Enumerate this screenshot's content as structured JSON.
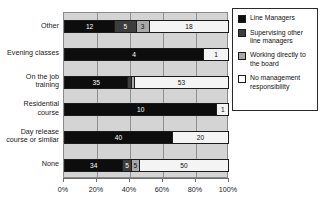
{
  "chart_data": {
    "type": "bar",
    "orientation": "horizontal",
    "stacked": true,
    "stacked_percent": true,
    "title": "",
    "subtitle": "",
    "xlabel": "",
    "ylabel": "",
    "xlim": [
      0,
      100
    ],
    "grid": true,
    "legend_position": "right",
    "xticks": [
      "0%",
      "20%",
      "40%",
      "60%",
      "80%",
      "100%"
    ],
    "xtick_values": [
      0,
      20,
      40,
      60,
      80,
      100
    ],
    "categories": [
      "Other",
      "Evening classes",
      "On the job\ntraining",
      "Residential\ncourse",
      "Day release\ncourse or similar",
      "None"
    ],
    "series": [
      {
        "name": "Line Managers",
        "color": "#0d0d0d",
        "values": [
          12,
          4,
          35,
          10,
          40,
          34
        ]
      },
      {
        "name": "Supervising other line managers",
        "color": "#3d3d3d",
        "values": [
          5,
          0,
          1,
          0,
          0,
          5
        ]
      },
      {
        "name": "Working directly to the board",
        "color": "#a8a8a8",
        "values": [
          3,
          0,
          1,
          0,
          0,
          5
        ]
      },
      {
        "name": "No management responsibility",
        "color": "#f4f4f4",
        "values": [
          18,
          1,
          53,
          1,
          20,
          50
        ]
      }
    ],
    "segment_percents": [
      [
        31,
        13,
        8,
        48
      ],
      [
        85,
        0,
        0,
        15
      ],
      [
        39,
        2,
        2,
        57
      ],
      [
        93,
        0,
        0,
        7
      ],
      [
        66,
        0,
        0,
        34
      ],
      [
        36,
        5,
        5,
        54
      ]
    ],
    "segment_labels": [
      [
        "12",
        "5",
        "3",
        "18"
      ],
      [
        "4",
        "",
        "",
        "1"
      ],
      [
        "35",
        "",
        "",
        "53"
      ],
      [
        "10",
        "",
        "",
        "1"
      ],
      [
        "40",
        "",
        "",
        "20"
      ],
      [
        "34",
        "5",
        "5",
        "50"
      ]
    ]
  },
  "legend": {
    "items": [
      {
        "label": "Line Managers",
        "swatch": "legend-swatch-line-managers"
      },
      {
        "label": "Supervising other line managers",
        "swatch": "legend-swatch-supervising"
      },
      {
        "label": "Working directly to the board",
        "swatch": "legend-swatch-board"
      },
      {
        "label": "No management responsibility",
        "swatch": "legend-swatch-none"
      }
    ]
  },
  "colors": {
    "series_0": "#0d0d0d",
    "series_1": "#3d3d3d",
    "series_2": "#a8a8a8",
    "series_3": "#f4f4f4",
    "plot_background": "#d4d4d4",
    "page_background": "#ffffff"
  }
}
